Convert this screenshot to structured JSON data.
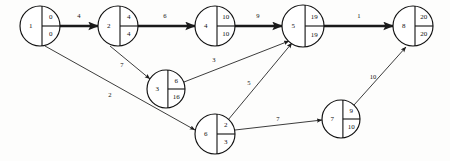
{
  "diagram": {
    "type": "activity-on-arrow-network",
    "nodes": [
      {
        "id": "1",
        "label": "1",
        "early": "0",
        "late": "0",
        "cx": 40,
        "cy": 26,
        "r": 20
      },
      {
        "id": "2",
        "label": "2",
        "early": "4",
        "late": "4",
        "cx": 118,
        "cy": 26,
        "r": 20
      },
      {
        "id": "3",
        "label": "3",
        "early": "6",
        "late": "16",
        "cx": 166,
        "cy": 89,
        "r": 19
      },
      {
        "id": "4",
        "label": "4",
        "early": "10",
        "late": "10",
        "cx": 215,
        "cy": 26,
        "r": 20
      },
      {
        "id": "5",
        "label": "5",
        "early": "19",
        "late": "19",
        "cx": 303,
        "cy": 26,
        "r": 21
      },
      {
        "id": "6",
        "label": "6",
        "early": "2",
        "late": "3",
        "cx": 215,
        "cy": 134,
        "r": 20
      },
      {
        "id": "7",
        "label": "7",
        "early": "9",
        "late": "10",
        "cx": 341,
        "cy": 119,
        "r": 19
      },
      {
        "id": "8",
        "label": "8",
        "early": "20",
        "late": "20",
        "cx": 413,
        "cy": 26,
        "r": 20
      }
    ],
    "edges": [
      {
        "from": "1",
        "to": "2",
        "label": "4",
        "critical": true,
        "x1": 60,
        "y1": 26,
        "x2": 98,
        "y2": 26,
        "lx": 79,
        "ly": 16
      },
      {
        "from": "2",
        "to": "4",
        "label": "6",
        "critical": true,
        "x1": 138,
        "y1": 26,
        "x2": 195,
        "y2": 26,
        "lx": 165,
        "ly": 16
      },
      {
        "from": "4",
        "to": "5",
        "label": "9",
        "critical": true,
        "x1": 235,
        "y1": 26,
        "x2": 282,
        "y2": 26,
        "lx": 258,
        "ly": 16
      },
      {
        "from": "5",
        "to": "8",
        "label": "1",
        "critical": true,
        "x1": 324,
        "y1": 26,
        "x2": 393,
        "y2": 26,
        "lx": 359,
        "ly": 16
      },
      {
        "from": "2",
        "to": "3",
        "label": "7",
        "critical": false,
        "x1": 110,
        "y1": 46,
        "x2": 150,
        "y2": 79,
        "lx": 122,
        "ly": 65
      },
      {
        "from": "3",
        "to": "5",
        "label": "3",
        "critical": false,
        "x1": 184,
        "y1": 82,
        "x2": 289,
        "y2": 41,
        "lx": 214,
        "ly": 60
      },
      {
        "from": "1",
        "to": "6",
        "label": "2",
        "critical": false,
        "x1": 45,
        "y1": 46,
        "x2": 195,
        "y2": 130,
        "lx": 110,
        "ly": 95
      },
      {
        "from": "6",
        "to": "5",
        "label": "5",
        "critical": false,
        "x1": 228,
        "y1": 120,
        "x2": 292,
        "y2": 43,
        "lx": 249,
        "ly": 83
      },
      {
        "from": "6",
        "to": "7",
        "label": "7",
        "critical": false,
        "x1": 235,
        "y1": 130,
        "x2": 322,
        "y2": 120,
        "lx": 278,
        "ly": 119
      },
      {
        "from": "7",
        "to": "8",
        "label": "10",
        "critical": false,
        "x1": 354,
        "y1": 105,
        "x2": 406,
        "y2": 47,
        "lx": 373,
        "ly": 77
      }
    ],
    "colors": {
      "node_stroke": "#111111",
      "node_fill": "#ffffff",
      "edge": "#1a1a1a",
      "background": "#fdfdfc"
    }
  }
}
